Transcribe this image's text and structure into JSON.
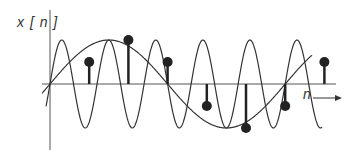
{
  "figure": {
    "y_axis_label": "x[n]",
    "y_axis_label_display": "x [ n ]",
    "x_axis_label": "n",
    "colors": {
      "curve": "#333333",
      "axis": "#555555",
      "stem": "#222222",
      "background": "#ffffff"
    }
  },
  "chart_data": {
    "type": "stem",
    "title": "",
    "xlabel": "n",
    "ylabel": "x[n]",
    "samples": {
      "n": [
        0,
        1,
        2,
        3,
        4,
        5,
        6,
        7
      ],
      "values": [
        0,
        0.5,
        1.0,
        0.5,
        -0.5,
        -1.0,
        -0.5,
        0.5
      ]
    },
    "continuous_curves": [
      {
        "name": "low-frequency sinusoid",
        "amplitude": 1.0,
        "period_samples": 6
      },
      {
        "name": "high-frequency sinusoid",
        "amplitude": 1.0,
        "period_samples": 1.2
      }
    ],
    "grid": false,
    "legend": false
  }
}
